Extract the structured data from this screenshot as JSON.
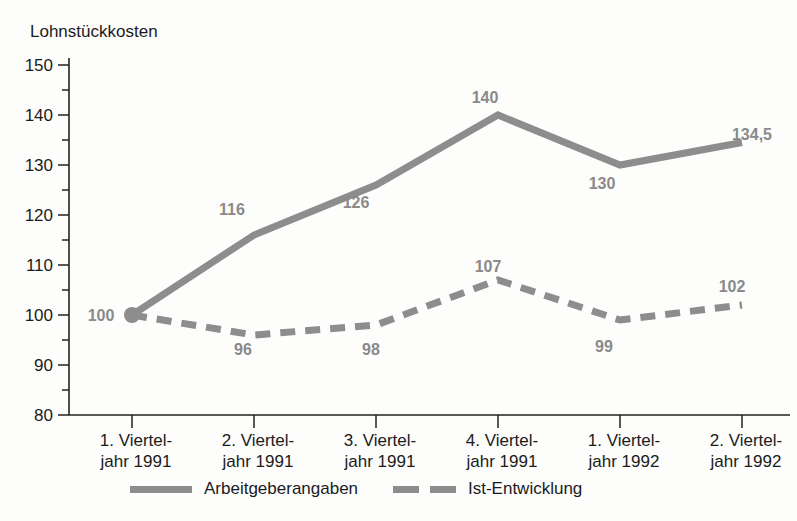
{
  "chart_data": {
    "type": "line",
    "title": "Lohnstückkosten",
    "xlabel": "",
    "ylabel": "Lohnstückkosten",
    "ylim": [
      80,
      150
    ],
    "ytick_values": [
      80,
      90,
      100,
      110,
      120,
      130,
      140,
      150
    ],
    "ytick_labels": [
      "80",
      "90",
      "100",
      "110",
      "120",
      "130",
      "140",
      "150"
    ],
    "yminor_values": [
      85,
      95,
      105,
      115,
      125,
      135,
      145
    ],
    "grid": false,
    "legend_position": "bottom",
    "categories": [
      "1. Viertel-\njahr 1991",
      "2. Viertel-\njahr 1991",
      "3. Viertel-\njahr 1991",
      "4. Viertel-\njahr 1991",
      "1. Viertel-\njahr 1992",
      "2. Viertel-\njahr 1992"
    ],
    "xtick_labels_line1": [
      "1. Viertel-",
      "2. Viertel-",
      "3. Viertel-",
      "4. Viertel-",
      "1. Viertel-",
      "2. Viertel-"
    ],
    "xtick_labels_line2": [
      "jahr 1991",
      "jahr 1991",
      "jahr 1991",
      "jahr 1991",
      "jahr 1992",
      "jahr 1992"
    ],
    "series": [
      {
        "name": "Arbeitgeberangaben",
        "style": "solid",
        "color": "#8d8d8d",
        "values": [
          100,
          116,
          126,
          140,
          130,
          134.5
        ],
        "labels": [
          "100",
          "116",
          "126",
          "140",
          "130",
          "134,5"
        ]
      },
      {
        "name": "Ist-Entwicklung",
        "style": "dashed",
        "color": "#8d8d8d",
        "values": [
          100,
          96,
          98,
          107,
          99,
          102
        ],
        "labels": [
          "100",
          "96",
          "98",
          "107",
          "99",
          "102"
        ]
      }
    ]
  },
  "legend": {
    "items": [
      {
        "label": "Arbeitgeberangaben",
        "style": "solid"
      },
      {
        "label": "Ist-Entwicklung",
        "style": "dashed"
      }
    ]
  },
  "axis": {
    "y_title": "Lohnstückkosten"
  },
  "value_labels": {
    "solid": {
      "p0": "100",
      "p1": "116",
      "p2": "126",
      "p3": "140",
      "p4": "130",
      "p5": "134,5"
    },
    "dashed": {
      "p1": "96",
      "p2": "98",
      "p3": "107",
      "p4": "99",
      "p5": "102"
    }
  },
  "yticks": {
    "t150": "150",
    "t140": "140",
    "t130": "130",
    "t120": "120",
    "t110": "110",
    "t100": "100",
    "t90": "90",
    "t80": "80"
  },
  "xticks": {
    "c0a": "1. Viertel-",
    "c0b": "jahr 1991",
    "c1a": "2. Viertel-",
    "c1b": "jahr 1991",
    "c2a": "3. Viertel-",
    "c2b": "jahr 1991",
    "c3a": "4. Viertel-",
    "c3b": "jahr 1991",
    "c4a": "1. Viertel-",
    "c4b": "jahr 1992",
    "c5a": "2. Viertel-",
    "c5b": "jahr 1992"
  },
  "colors": {
    "series": "#8d8d8d",
    "axis": "#222222",
    "text": "#1b1b1b",
    "value_label": "#8a8a8a"
  }
}
